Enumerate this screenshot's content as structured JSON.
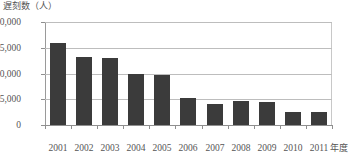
{
  "chart_data": {
    "type": "bar",
    "title": "遅刻数（人）",
    "xlabel": "年度",
    "ylabel": "遅刻数（人）",
    "categories": [
      "2001",
      "2002",
      "2003",
      "2004",
      "2005",
      "2006",
      "2007",
      "2008",
      "2009",
      "2010",
      "2011"
    ],
    "values": [
      15900,
      13200,
      13000,
      10000,
      9800,
      5200,
      4000,
      4700,
      4400,
      2600,
      2600
    ],
    "ylim": [
      0,
      20000
    ],
    "ytick_labels": [
      "0",
      "5,000",
      "10,000",
      "15,000",
      "20,000"
    ],
    "ytick_values": [
      0,
      5000,
      10000,
      15000,
      20000
    ],
    "grid": true,
    "legend": "none",
    "series_name": "遅刻数",
    "bar_color": "#3b3b3b",
    "grid_color": "#bdbdbd",
    "axis_color": "#8f8f8f",
    "text_color": "#555555",
    "background_color": "#ffffff"
  }
}
